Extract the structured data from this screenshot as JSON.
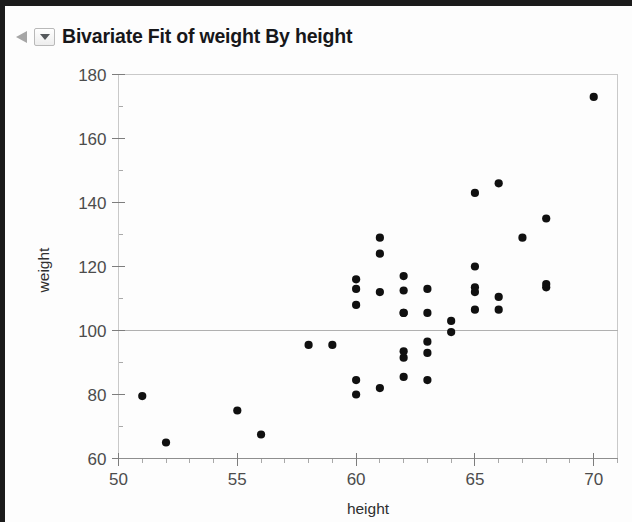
{
  "window": {
    "background_color": "#fdfdfd",
    "border_color": "#1b1b1b"
  },
  "header": {
    "title": "Bivariate Fit of weight By height",
    "disclosure_icon": "disclosure-triangle-icon",
    "outline_menu_icon": "chevron-down-icon"
  },
  "chart_data": {
    "type": "scatter",
    "title": "Bivariate Fit of weight By height",
    "xlabel": "height",
    "ylabel": "weight",
    "xlim": [
      50,
      71
    ],
    "ylim": [
      60,
      180
    ],
    "xticks": [
      50,
      55,
      60,
      65,
      70
    ],
    "yticks": [
      60,
      80,
      100,
      120,
      140,
      160,
      180
    ],
    "x_minor_step": 1,
    "y_minor_step": 10,
    "grid": false,
    "legend": null,
    "marker_color": "#101010",
    "marker_size": 7,
    "reference_lines": [
      {
        "axis": "y",
        "value": 100,
        "color": "#b0b0b0"
      }
    ],
    "x": [
      51,
      52,
      55,
      56,
      58,
      59,
      60,
      60,
      60,
      60,
      60,
      61,
      61,
      61,
      61,
      62,
      62,
      62,
      62,
      62,
      62,
      62,
      63,
      63,
      63,
      63,
      63,
      64,
      64,
      65,
      65,
      65,
      65,
      65,
      66,
      66,
      66,
      67,
      68,
      68,
      68,
      70
    ],
    "y": [
      79.5,
      65,
      75,
      67.5,
      95.5,
      95.5,
      80,
      84.5,
      108,
      113,
      116,
      82,
      112,
      124,
      129,
      85.5,
      91.5,
      93.5,
      105.5,
      105.5,
      112.5,
      117,
      84.5,
      93,
      96.5,
      105.5,
      113,
      99.5,
      103,
      106.5,
      112,
      113.5,
      120,
      143,
      106.5,
      110.5,
      146,
      129,
      113.5,
      114.5,
      135,
      173
    ],
    "series_name": "weight vs height",
    "n_points": 42
  },
  "axis": {
    "x_tick_labels": [
      "50",
      "55",
      "60",
      "65",
      "70"
    ],
    "y_tick_labels": [
      "180",
      "160",
      "140",
      "120",
      "100",
      "80",
      "60"
    ],
    "x_title": "height",
    "y_title": "weight"
  }
}
